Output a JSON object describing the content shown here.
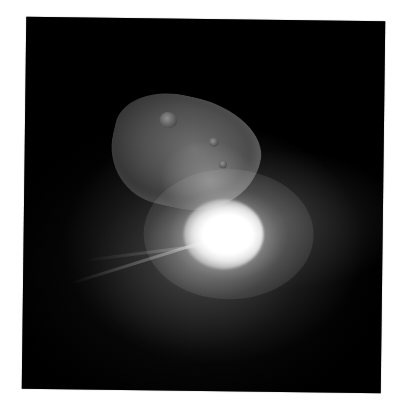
{
  "image": {
    "subject": "comet nucleus with bright impact flash and ejecta spray",
    "background_color": "#ffffff",
    "photo_background": "#000000",
    "elements": {
      "nucleus": "comet-nucleus",
      "flash": "impact-flash",
      "spray": "ejecta-plume"
    }
  }
}
